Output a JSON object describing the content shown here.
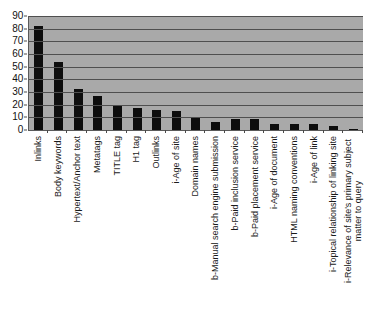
{
  "chart_data": {
    "type": "bar",
    "title": "",
    "xlabel": "",
    "ylabel": "",
    "ylim": [
      0,
      90
    ],
    "ytick_step": 10,
    "yticks": [
      "90",
      "80",
      "70",
      "60",
      "50",
      "40",
      "30",
      "20",
      "10",
      "0"
    ],
    "grid": true,
    "legend": "none",
    "orientation": "vertical",
    "bar_color": "#0d0d0d",
    "plot_background": "#a9a9a9",
    "gridline_color": "#4f4f4f",
    "categories": [
      "Inlinks",
      "Body keywords",
      "Hypertext/Anchor text",
      "Metatags",
      "TITLE tag",
      "H1 tag",
      "Outlinks",
      "i-Age of site",
      "Domain names",
      "b-Manual search engine submission",
      "b-Paid inclusion service",
      "b-Paid placement service",
      "i-Age of document",
      "HTML naming conventions",
      "i-Age of link",
      "i-Topical relationship of linking site",
      "i-Relevance of site's primary subject matter to query"
    ],
    "values": [
      82,
      54,
      32,
      27,
      19,
      17,
      16,
      15,
      10,
      6,
      9,
      9,
      5,
      5,
      5,
      3,
      1
    ]
  }
}
